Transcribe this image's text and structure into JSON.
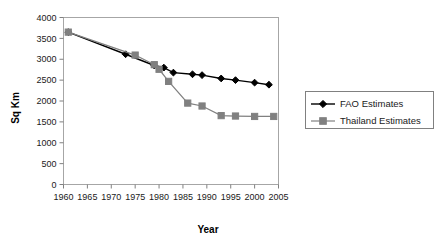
{
  "chart_data": {
    "type": "line",
    "title": "",
    "xlabel": "Year",
    "ylabel": "Sq Km",
    "xlim": [
      1960,
      2005
    ],
    "ylim": [
      0,
      4000
    ],
    "grid": false,
    "legend_position": "right",
    "xticks": [
      "1960",
      "1965",
      "1970",
      "1975",
      "1980",
      "1985",
      "1990",
      "1995",
      "2000",
      "2005"
    ],
    "yticks": [
      "0",
      "500",
      "1000",
      "1500",
      "2000",
      "2500",
      "3000",
      "3500",
      "4000"
    ],
    "series": [
      {
        "name": "FAO Estimates",
        "marker": "diamond",
        "color": "#000000",
        "x": [
          1961,
          1973,
          1979,
          1981,
          1983,
          1987,
          1989,
          1993,
          1996,
          2000,
          2003
        ],
        "values": [
          3650,
          3120,
          2850,
          2800,
          2680,
          2640,
          2620,
          2540,
          2500,
          2440,
          2390
        ]
      },
      {
        "name": "Thailand Estimates",
        "marker": "square",
        "color": "#808080",
        "x": [
          1961,
          1975,
          1979,
          1980,
          1982,
          1986,
          1989,
          1993,
          1996,
          2000,
          2004
        ],
        "values": [
          3650,
          3100,
          2870,
          2760,
          2470,
          1950,
          1880,
          1650,
          1640,
          1630,
          1630
        ]
      }
    ]
  },
  "legend": {
    "items": [
      {
        "label": "FAO Estimates"
      },
      {
        "label": "Thailand Estimates"
      }
    ]
  },
  "axes": {
    "x_title": "Year",
    "y_title": "Sq Km"
  }
}
